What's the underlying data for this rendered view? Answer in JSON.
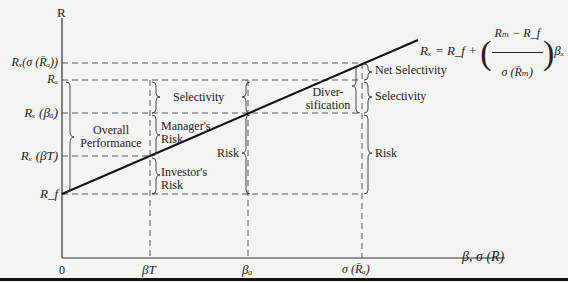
{
  "diagram": {
    "type": "performance-decomposition",
    "axes": {
      "y_label": "R",
      "x_label": "β, σ (R)",
      "origin_label": "0"
    },
    "y_ticks": [
      {
        "id": "rx_sigma",
        "label": "Rₓ(σ (R̄ₐ))"
      },
      {
        "id": "ra",
        "label": "Rₐ"
      },
      {
        "id": "rx_beta_a",
        "label": "Rₓ (βₐ)"
      },
      {
        "id": "rx_beta_t",
        "label": "Rₓ (βT)"
      },
      {
        "id": "rf",
        "label": "R_f"
      }
    ],
    "x_ticks": [
      {
        "id": "beta_t",
        "label": "βT"
      },
      {
        "id": "beta_a",
        "label": "βₐ"
      },
      {
        "id": "sigma_ra",
        "label": "σ (R̄ₐ)"
      }
    ],
    "equation": {
      "lhs": "Rₓ = R_f +",
      "numerator": "Rₘ − R_f",
      "denominator": "σ (R̄ₘ)",
      "suffix": "βₓ"
    },
    "brace_labels": {
      "overall_line1": "Overall",
      "overall_line2": "Performance",
      "selectivity_mid": "Selectivity",
      "manager_line1": "Manager's",
      "manager_line2": "Risk",
      "investor_line1": "Investor's",
      "investor_line2": "Risk",
      "risk_mid": "Risk",
      "divers_line1": "Diver-",
      "divers_line2": "sification",
      "net_selectivity": "Net Selectivity",
      "selectivity_right": "Selectivity",
      "risk_right": "Risk"
    }
  }
}
